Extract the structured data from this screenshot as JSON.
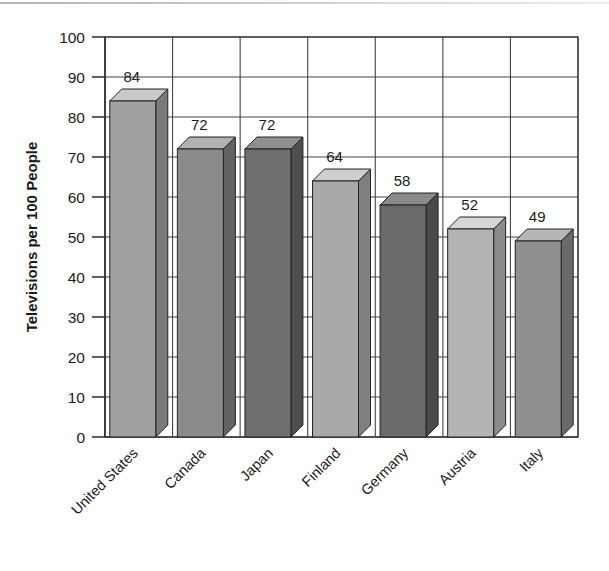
{
  "chart_data": {
    "type": "bar",
    "title": "",
    "xlabel": "",
    "ylabel": "Televisions per 100 People",
    "categories": [
      "United States",
      "Canada",
      "Japan",
      "Finland",
      "Germany",
      "Austria",
      "Italy"
    ],
    "values": [
      84,
      72,
      72,
      64,
      58,
      52,
      49
    ],
    "value_labels": [
      "84",
      "72",
      "72",
      "64",
      "58",
      "52",
      "49"
    ],
    "ylim": [
      0,
      100
    ],
    "ytick_labels": [
      "100",
      "90",
      "80",
      "70",
      "60",
      "50",
      "40",
      "30",
      "20",
      "10",
      "0"
    ],
    "ytick_values": [
      100,
      90,
      80,
      70,
      60,
      50,
      40,
      30,
      20,
      10,
      0
    ],
    "grid": true,
    "legend_position": "none",
    "style": "3d-columns",
    "bar_colors": [
      "#a0a0a0",
      "#8a8a8a",
      "#6e6e6e",
      "#a8a8a8",
      "#6a6a6a",
      "#b4b4b4",
      "#8f8f8f"
    ],
    "bar_top_colors": [
      "#c9c9c9",
      "#b2b2b2",
      "#8f8f8f",
      "#cfcfcf",
      "#8a8a8a",
      "#d6d6d6",
      "#b6b6b6"
    ],
    "bar_side_colors": [
      "#7a7a7a",
      "#636363",
      "#4e4e4e",
      "#7f7f7f",
      "#4a4a4a",
      "#8a8a8a",
      "#6a6a6a"
    ],
    "axis_color": "#2b2b2b",
    "grid_color": "#444444",
    "text_color": "#1b1b1b",
    "background": "#ffffff"
  }
}
